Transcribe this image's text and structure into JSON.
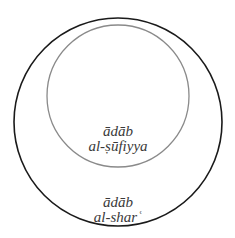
{
  "diagram": {
    "type": "nested-circles",
    "outer_circle": {
      "label_line1": "ādāb",
      "label_line2": "al-sharʿ",
      "stroke": "#1a1a1a"
    },
    "inner_circle": {
      "label_line1": "ādāb",
      "label_line2": "al-ṣūfiyya",
      "stroke": "#8a8a8a"
    }
  }
}
